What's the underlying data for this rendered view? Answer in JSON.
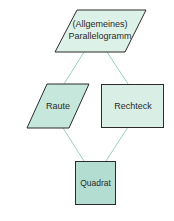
{
  "diagram": {
    "type": "hierarchy",
    "colors": {
      "fill_light": "#d9efe6",
      "fill_dark": "#b3ddd0",
      "stroke": "#2b2b2b",
      "edge": "#9ccfc0"
    },
    "nodes": {
      "parallelogram": {
        "line1": "(Allgemeines)",
        "line2": "Parallelogramm",
        "shape": "parallelogram"
      },
      "rhombus": {
        "label": "Raute",
        "shape": "parallelogram"
      },
      "rectangle": {
        "label": "Rechteck",
        "shape": "rectangle"
      },
      "square": {
        "label": "Quadrat",
        "shape": "square"
      }
    },
    "edges": [
      {
        "from": "parallelogram",
        "to": "rhombus"
      },
      {
        "from": "parallelogram",
        "to": "rectangle"
      },
      {
        "from": "rhombus",
        "to": "square"
      },
      {
        "from": "rectangle",
        "to": "square"
      }
    ]
  }
}
